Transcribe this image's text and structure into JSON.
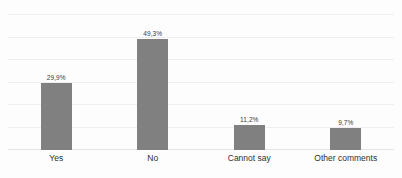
{
  "chart_data": {
    "type": "bar",
    "title": "",
    "subtitle": "",
    "xlabel": "",
    "ylabel": "",
    "categories": [
      "Yes",
      "No",
      "Cannot say",
      "Other comments"
    ],
    "values": [
      29.9,
      49.3,
      11.2,
      9.7
    ],
    "value_labels": [
      "29,9%",
      "49,3%",
      "11,2%",
      "9,7%"
    ],
    "series": [
      {
        "name": "",
        "values": [
          29.9,
          49.3,
          11.2,
          9.7
        ]
      }
    ],
    "ylim": [
      0,
      60
    ],
    "y_tick_values": [
      0,
      10,
      20,
      30,
      40,
      50,
      60
    ],
    "y_tick_labels_visible": false,
    "grid": true,
    "grid_orientation": "horizontal",
    "legend": false,
    "legend_position": "none",
    "bar_color": "#808080",
    "background_color": "#fdfdfd",
    "gridline_color": "#eceef0",
    "label_color": "#2f2f2f",
    "value_label_color": "#3a3a3a",
    "decimal_separator": ","
  }
}
